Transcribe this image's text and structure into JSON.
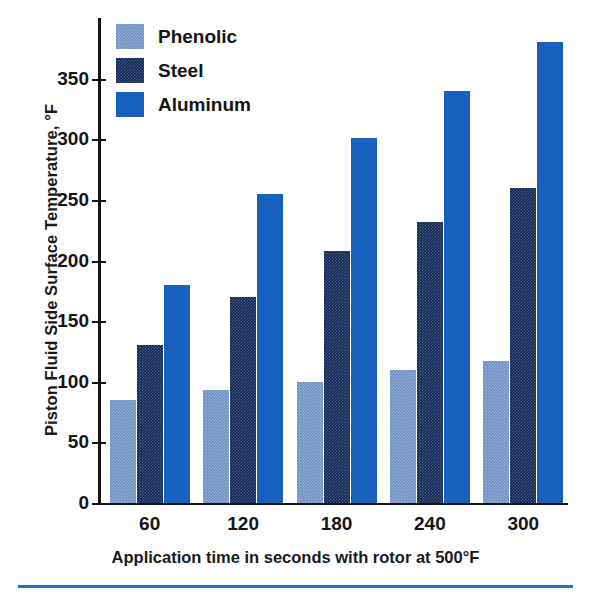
{
  "chart_data": {
    "type": "bar",
    "title": "",
    "xlabel": "Application time in seconds with rotor at 500°F",
    "ylabel": "Piston Fluid Side Surface Temperature, °F",
    "categories": [
      "60",
      "120",
      "180",
      "240",
      "300"
    ],
    "series": [
      {
        "name": "Phenolic",
        "color": "#6b8fc4",
        "pattern": "fine-checker",
        "values": [
          85,
          93,
          100,
          110,
          117
        ]
      },
      {
        "name": "Steel",
        "color": "#12244e",
        "pattern": "fine-checker",
        "values": [
          130,
          170,
          208,
          232,
          260
        ]
      },
      {
        "name": "Aluminum",
        "color": "#1760bd",
        "pattern": "solid",
        "values": [
          180,
          255,
          301,
          340,
          380
        ]
      }
    ],
    "ylim": [
      0,
      400
    ],
    "yticks": [
      0,
      50,
      100,
      150,
      200,
      250,
      300,
      350
    ],
    "ytick_labels": [
      "0",
      "50",
      "100",
      "150",
      "200",
      "250",
      "300",
      "350"
    ],
    "grid": false,
    "legend_position": "top-left-inside",
    "axis_color": "#141414",
    "background": "#ffffff"
  },
  "legend": {
    "items": [
      {
        "label": "Phenolic"
      },
      {
        "label": "Steel"
      },
      {
        "label": "Aluminum"
      }
    ]
  },
  "footer": {
    "rule_color": "#2a6fb8"
  }
}
